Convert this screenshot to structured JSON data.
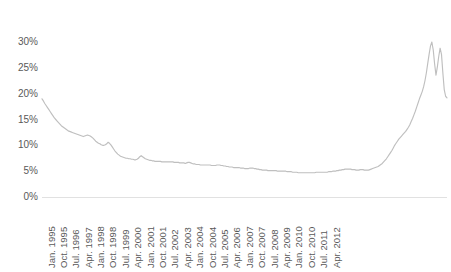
{
  "chart_data": {
    "type": "line",
    "title": "",
    "subtitle": "",
    "xlabel": "",
    "ylabel": "",
    "grid": false,
    "legend": false,
    "legend_position": "none",
    "series_color": "#bfbfbf",
    "axis_color": "#d9d9d9",
    "tick_label_color": "#595959",
    "ylim": [
      0,
      0.325
    ],
    "ytick_labels": [
      "30%",
      "25%",
      "20%",
      "15%",
      "10%",
      "5%",
      "0%"
    ],
    "ytick_values": [
      0.3,
      0.25,
      0.2,
      0.15,
      0.1,
      0.05,
      0.0
    ],
    "xtick_labels": [
      "Jan. 1995",
      "Oct. 1995",
      "Jul. 1996",
      "Apr. 1997",
      "Jan. 1998",
      "Oct. 1998",
      "Jul. 1999",
      "Apr. 2000",
      "Jan. 2001",
      "Oct. 2001",
      "Jul. 2002",
      "Apr. 2003",
      "Jan. 2004",
      "Oct. 2004",
      "Jul. 2005",
      "Apr. 2006",
      "Jan. 2007",
      "Oct. 2007",
      "Jul. 2008",
      "Apr. 2009",
      "Jan. 2010",
      "Oct. 2010",
      "Jul. 2011",
      "Apr. 2012"
    ],
    "xtick_interval_months": 9,
    "x_start": "Jan. 1995",
    "x_end": "Jul. 2012",
    "x_sampling": "monthly",
    "series": [
      {
        "name": "Rate",
        "values": [
          0.19,
          0.186,
          0.181,
          0.177,
          0.173,
          0.169,
          0.165,
          0.161,
          0.157,
          0.153,
          0.15,
          0.147,
          0.144,
          0.141,
          0.138,
          0.136,
          0.134,
          0.132,
          0.13,
          0.128,
          0.127,
          0.126,
          0.125,
          0.124,
          0.123,
          0.122,
          0.121,
          0.12,
          0.119,
          0.118,
          0.117,
          0.118,
          0.119,
          0.12,
          0.119,
          0.118,
          0.116,
          0.114,
          0.111,
          0.108,
          0.106,
          0.104,
          0.103,
          0.101,
          0.1,
          0.1,
          0.101,
          0.103,
          0.106,
          0.104,
          0.101,
          0.097,
          0.093,
          0.089,
          0.086,
          0.083,
          0.081,
          0.079,
          0.078,
          0.077,
          0.076,
          0.075,
          0.075,
          0.074,
          0.074,
          0.073,
          0.073,
          0.072,
          0.072,
          0.073,
          0.075,
          0.078,
          0.08,
          0.078,
          0.076,
          0.074,
          0.073,
          0.072,
          0.071,
          0.071,
          0.07,
          0.07,
          0.069,
          0.069,
          0.069,
          0.069,
          0.069,
          0.068,
          0.068,
          0.068,
          0.068,
          0.068,
          0.068,
          0.068,
          0.068,
          0.068,
          0.067,
          0.067,
          0.067,
          0.067,
          0.066,
          0.066,
          0.066,
          0.066,
          0.065,
          0.066,
          0.067,
          0.067,
          0.066,
          0.065,
          0.064,
          0.064,
          0.063,
          0.063,
          0.063,
          0.062,
          0.062,
          0.062,
          0.062,
          0.062,
          0.062,
          0.062,
          0.062,
          0.061,
          0.061,
          0.061,
          0.061,
          0.062,
          0.062,
          0.062,
          0.061,
          0.061,
          0.06,
          0.06,
          0.059,
          0.059,
          0.058,
          0.058,
          0.058,
          0.057,
          0.057,
          0.057,
          0.057,
          0.057,
          0.056,
          0.056,
          0.056,
          0.055,
          0.055,
          0.055,
          0.055,
          0.056,
          0.056,
          0.056,
          0.055,
          0.055,
          0.054,
          0.054,
          0.053,
          0.053,
          0.052,
          0.052,
          0.052,
          0.052,
          0.051,
          0.051,
          0.051,
          0.051,
          0.051,
          0.051,
          0.051,
          0.05,
          0.05,
          0.05,
          0.05,
          0.05,
          0.05,
          0.05,
          0.049,
          0.049,
          0.049,
          0.049,
          0.048,
          0.048,
          0.048,
          0.048,
          0.047,
          0.047,
          0.047,
          0.047,
          0.047,
          0.047,
          0.047,
          0.047,
          0.047,
          0.047,
          0.047,
          0.047,
          0.047,
          0.048,
          0.048,
          0.048,
          0.048,
          0.048,
          0.048,
          0.048,
          0.048,
          0.048,
          0.049,
          0.049,
          0.049,
          0.05,
          0.05,
          0.05,
          0.051,
          0.051,
          0.052,
          0.052,
          0.053,
          0.053,
          0.054,
          0.054,
          0.054,
          0.054,
          0.054,
          0.053,
          0.053,
          0.053,
          0.052,
          0.052,
          0.052,
          0.053,
          0.053,
          0.053,
          0.052,
          0.052,
          0.052,
          0.052,
          0.053,
          0.054,
          0.055,
          0.056,
          0.057,
          0.058,
          0.059,
          0.061,
          0.063,
          0.065,
          0.068,
          0.071,
          0.074,
          0.078,
          0.082,
          0.086,
          0.09,
          0.095,
          0.1,
          0.104,
          0.108,
          0.112,
          0.115,
          0.118,
          0.121,
          0.124,
          0.127,
          0.131,
          0.135,
          0.14,
          0.146,
          0.152,
          0.159,
          0.166,
          0.174,
          0.182,
          0.19,
          0.197,
          0.204,
          0.213,
          0.225,
          0.24,
          0.258,
          0.276,
          0.292,
          0.3,
          0.285,
          0.258,
          0.236,
          0.252,
          0.272,
          0.288,
          0.276,
          0.24,
          0.208,
          0.195,
          0.192
        ]
      }
    ]
  }
}
